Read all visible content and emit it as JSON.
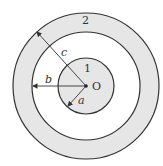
{
  "diagram": {
    "type": "concentric-circles",
    "center_label": "O",
    "regions": [
      {
        "label": "1",
        "description": "inner solid cylinder of radius a",
        "fill": "#e6e6e6"
      },
      {
        "label": "2",
        "description": "outer shell between radius b and c",
        "fill": "#e6e6e6"
      }
    ],
    "radii": [
      {
        "label": "a",
        "px": 28
      },
      {
        "label": "b",
        "px": 54
      },
      {
        "label": "c",
        "px": 73
      }
    ],
    "colors": {
      "stroke": "#333333",
      "shaded": "#e6e6e6",
      "gap": "#ffffff"
    }
  }
}
